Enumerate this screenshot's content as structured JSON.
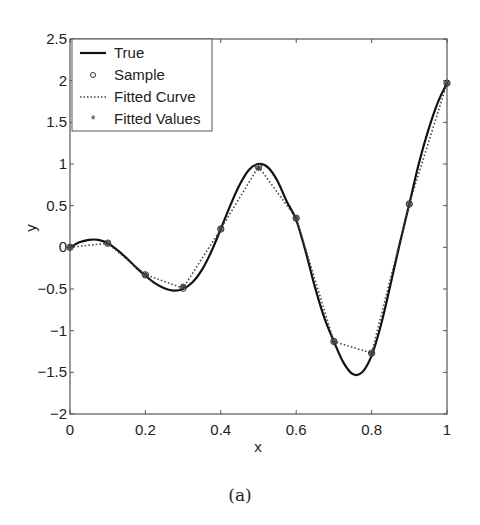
{
  "chart_data": {
    "type": "line",
    "title": "",
    "caption": "(a)",
    "xlabel": "x",
    "ylabel": "y",
    "xlim": [
      0,
      1
    ],
    "ylim": [
      -2,
      2.5
    ],
    "xticks": [
      0,
      0.2,
      0.4,
      0.6,
      0.8,
      1
    ],
    "xtick_labels": [
      "0",
      "0.2",
      "0.4",
      "0.6",
      "0.8",
      "1"
    ],
    "yticks": [
      -2,
      -1.5,
      -1,
      -0.5,
      0,
      0.5,
      1,
      1.5,
      2,
      2.5
    ],
    "ytick_labels": [
      "-2",
      "-1.5",
      "-1",
      "-0.5",
      "0",
      "0.5",
      "1",
      "1.5",
      "2",
      "2.5"
    ],
    "grid": false,
    "legend_position": "upper left",
    "legend": [
      "True",
      "Sample",
      "Fitted Curve",
      "Fitted Values"
    ],
    "series": [
      {
        "name": "True",
        "style": "solid",
        "x": [
          0,
          0.025,
          0.05,
          0.075,
          0.1,
          0.125,
          0.15,
          0.175,
          0.2,
          0.225,
          0.25,
          0.275,
          0.3,
          0.325,
          0.35,
          0.375,
          0.4,
          0.425,
          0.45,
          0.475,
          0.5,
          0.525,
          0.55,
          0.575,
          0.6,
          0.625,
          0.65,
          0.675,
          0.7,
          0.725,
          0.75,
          0.775,
          0.8,
          0.825,
          0.85,
          0.875,
          0.9,
          0.925,
          0.95,
          0.975,
          1
        ],
        "y": [
          0,
          0.06,
          0.09,
          0.09,
          0.05,
          -0.03,
          -0.13,
          -0.24,
          -0.34,
          -0.43,
          -0.49,
          -0.52,
          -0.5,
          -0.42,
          -0.27,
          -0.05,
          0.22,
          0.5,
          0.75,
          0.93,
          1.0,
          0.96,
          0.8,
          0.55,
          0.33,
          -0.05,
          -0.48,
          -0.85,
          -1.13,
          -1.38,
          -1.52,
          -1.5,
          -1.3,
          -0.93,
          -0.45,
          0.05,
          0.52,
          1.0,
          1.4,
          1.73,
          1.97
        ]
      },
      {
        "name": "Sample",
        "style": "open-circle",
        "x": [
          0,
          0.1,
          0.2,
          0.3,
          0.4,
          0.5,
          0.6,
          0.7,
          0.8,
          0.9,
          1
        ],
        "y": [
          0,
          0.05,
          -0.33,
          -0.49,
          0.22,
          0.97,
          0.35,
          -1.13,
          -1.27,
          0.52,
          1.97
        ]
      },
      {
        "name": "Fitted Curve",
        "style": "dotted",
        "x": [
          0,
          0.1,
          0.2,
          0.3,
          0.4,
          0.5,
          0.6,
          0.7,
          0.8,
          0.9,
          1
        ],
        "y": [
          0,
          0.05,
          -0.33,
          -0.49,
          0.22,
          0.97,
          0.35,
          -1.13,
          -1.27,
          0.52,
          1.97
        ]
      },
      {
        "name": "Fitted Values",
        "style": "star",
        "x": [
          0,
          0.1,
          0.2,
          0.3,
          0.4,
          0.5,
          0.6,
          0.7,
          0.8,
          0.9,
          1
        ],
        "y": [
          0,
          0.05,
          -0.33,
          -0.47,
          0.22,
          0.95,
          0.35,
          -1.13,
          -1.27,
          0.52,
          1.97
        ]
      }
    ]
  }
}
